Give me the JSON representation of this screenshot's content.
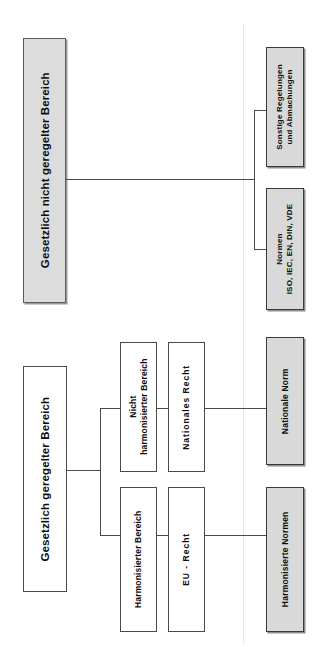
{
  "diagram": {
    "orientation": "rotated-90",
    "colors": {
      "shaded_fill": "#d9d9d9",
      "plain_fill": "#ffffff",
      "stroke": "#4a4a4a",
      "text": "#0d0d0d"
    },
    "branches": [
      {
        "id": "nicht-geregelt",
        "root": {
          "label": "Gesetzlich nicht geregelter Bereich",
          "shaded": true
        },
        "leaves": [
          {
            "id": "sonstige-regelungen",
            "line1": "Sonstige Regelungen",
            "line2": "und Abmachungen",
            "shaded": true
          },
          {
            "id": "normen",
            "line1": "Normen",
            "line2": "ISO, IEC, EN, DIN, VDE",
            "shaded": true
          }
        ]
      },
      {
        "id": "geregelt",
        "root": {
          "label": "Gesetzlich geregelter Bereich",
          "shaded": false
        },
        "paths": [
          {
            "id": "nicht-harmonisiert",
            "area": {
              "line1": "Nicht",
              "line2": "harmonisierter Bereich"
            },
            "law": {
              "label": "Nationales Recht"
            },
            "norm": {
              "label": "Nationale Norm",
              "shaded": true
            }
          },
          {
            "id": "harmonisiert",
            "area": {
              "line1": "Harmonisierter Bereich",
              "line2": ""
            },
            "law": {
              "label": "EU - Recht"
            },
            "norm": {
              "label": "Harmonisierte Normen",
              "shaded": true
            }
          }
        ]
      }
    ]
  }
}
